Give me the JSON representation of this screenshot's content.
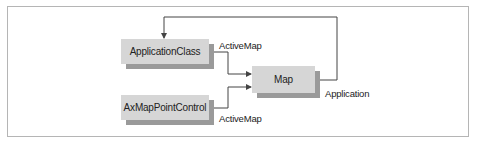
{
  "diagram": {
    "nodes": [
      {
        "id": "application-class",
        "label": "ApplicationClass"
      },
      {
        "id": "ax-map-point-control",
        "label": "AxMapPointControl"
      },
      {
        "id": "map",
        "label": "Map"
      }
    ],
    "edges": [
      {
        "from": "application-class",
        "to": "map",
        "label": "ActiveMap"
      },
      {
        "from": "ax-map-point-control",
        "to": "map",
        "label": "ActiveMap"
      },
      {
        "from": "map",
        "to": "application-class",
        "label": "Application"
      }
    ]
  },
  "colors": {
    "box_fill": "#d6d6d6",
    "box_shadow": "#9a9a9a",
    "line": "#444444",
    "frame": "#b5b5b5"
  }
}
